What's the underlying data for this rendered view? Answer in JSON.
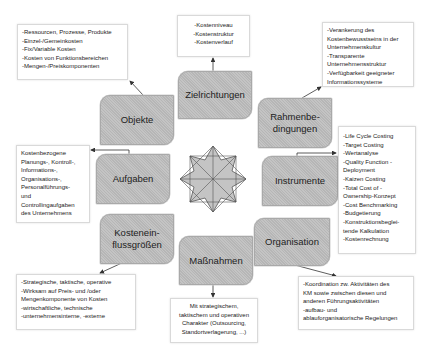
{
  "diagram": {
    "center_icon": "eight-point-star",
    "nodes": [
      {
        "id": "objekte",
        "label": "Objekte"
      },
      {
        "id": "zielrichtungen",
        "label": "Zielrichtungen"
      },
      {
        "id": "rahmenbedingungen",
        "label_lines": [
          "Rahmenbe-",
          "dingungen"
        ]
      },
      {
        "id": "aufgaben",
        "label": "Aufgaben"
      },
      {
        "id": "instrumente",
        "label": "Instrumente"
      },
      {
        "id": "kosteneinflussgroessen",
        "label_lines": [
          "Kostenein-",
          "flussgrößen"
        ]
      },
      {
        "id": "massnahmen",
        "label": "Maßnahmen"
      },
      {
        "id": "organisation",
        "label": "Organisation"
      }
    ],
    "notes": {
      "objekte": [
        "-Ressourcen, Prozesse, Produkte",
        "-Einzel-/Gemeinkosten",
        "-Fix/Variable Kosten",
        "-Kosten von Funktionsbereichen",
        "-Mengen-/Preiskomponenten"
      ],
      "zielrichtungen": [
        "-Kostenniveau",
        "-Kostenstruktur",
        "-Kostenverlauf"
      ],
      "rahmenbedingungen": [
        "-Verankerung des",
        "Kostenbewusstseins in der",
        "Unternehmenskultur",
        "-Transparente",
        "Unternehmensstruktur",
        "-Verfügbarkeit geeigneter",
        "Informationssysteme"
      ],
      "aufgaben": [
        "Kostenbezogene",
        "Planungs-, Kontroll-,",
        "Informations-,",
        "Organisations-,",
        "Personalführungs-",
        "und",
        "Controllingaufgaben",
        "des Unternehmens"
      ],
      "instrumente": [
        "-Life Cycle Costing",
        "-Target Costing",
        "-Wertanalyse",
        "-Quality Function -",
        "Deployment",
        "-Kaizen Costing",
        "-Total Cost of -",
        "Ownership-Konzept",
        "-Cost Benchmarking",
        "-Budgetierung",
        "-Konstruktionsbeglei-",
        "tende Kalkulation",
        "-Kostenrechnung"
      ],
      "kosteneinflussgroessen": [
        "-Strategische, taktische, operative",
        "-Wirksam auf Preis- und /oder",
        "Mengenkomponente von Kosten",
        "-wirtschaftliche, technische",
        "-unternehmensinterne, -externe"
      ],
      "massnahmen": [
        "Mit strategischem,",
        "taktischem und operativen",
        "Charakter (Outsourcing,",
        "Standortverlagerung, ...)"
      ],
      "organisation": [
        "-Koordination zw. Aktivitäten des",
        "KM sowie zwischen diesen und",
        "anderen Führungsaktivitäten",
        "-aufbau- und",
        "ablauforganisatorische Regelungen"
      ]
    },
    "colors": {
      "node_fill": "#bdbdbd",
      "node_border": "#a9a9a9",
      "note_border": "#d9d9d9",
      "arrow": "#333333",
      "star_fill": "#c4c4c4",
      "star_stroke": "#555555"
    }
  }
}
